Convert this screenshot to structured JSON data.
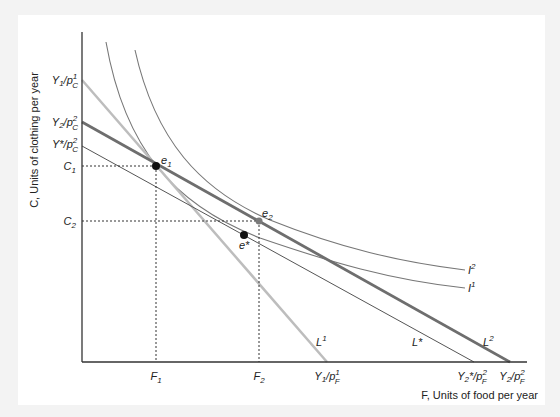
{
  "figure": {
    "y_axis_label": "C, Units of clothing per year",
    "x_axis_label": "F, Units of food per year",
    "y_ticks": [
      {
        "id": "y1pc1",
        "base": "Y",
        "bsub": "1",
        "mid": "/p",
        "sup": "1",
        "sub": "C",
        "y": 80
      },
      {
        "id": "y2pc2",
        "base": "Y",
        "bsub": "2",
        "mid": "/p",
        "sup": "2",
        "sub": "C",
        "y": 122
      },
      {
        "id": "ystarpc2",
        "base": "Y*",
        "bsub": "",
        "mid": "/p",
        "sup": "2",
        "sub": "C",
        "y": 146
      },
      {
        "id": "c1",
        "base": "C",
        "bsub": "1",
        "y": 166
      },
      {
        "id": "c2",
        "base": "C",
        "bsub": "2",
        "y": 221
      }
    ],
    "x_ticks": [
      {
        "id": "f1",
        "base": "F",
        "bsub": "1",
        "x": 156
      },
      {
        "id": "f2",
        "base": "F",
        "bsub": "2",
        "x": 259
      },
      {
        "id": "y1pf1",
        "base": "Y",
        "bsub": "1",
        "mid": "/p",
        "sup": "1",
        "sub": "F",
        "x": 327
      },
      {
        "id": "ystar2pf2",
        "base": "Y",
        "bsub": "2",
        "mid": "*/p",
        "sup": "2",
        "sub": "F",
        "x": 474
      },
      {
        "id": "y2pf2",
        "base": "Y",
        "bsub": "2",
        "mid": "/p",
        "sup": "2",
        "sub": "F",
        "x": 510
      }
    ],
    "points": [
      {
        "id": "e1",
        "label": "e",
        "sub": "1",
        "x": 156,
        "y": 166,
        "color": "#111111"
      },
      {
        "id": "e2",
        "label": "e",
        "sub": "2",
        "x": 259,
        "y": 221,
        "color": "#7a7a7a"
      },
      {
        "id": "estar",
        "label": "e*",
        "sub": "",
        "x": 244,
        "y": 235,
        "color": "#111111"
      }
    ],
    "lines": [
      {
        "id": "L1",
        "label": "L",
        "sup": "1",
        "from": [
          82,
          80
        ],
        "to": [
          327,
          362
        ],
        "color": "#bdbdbd",
        "width": 2.5
      },
      {
        "id": "L2",
        "label": "L",
        "sup": "2",
        "from": [
          82,
          122
        ],
        "to": [
          510,
          362
        ],
        "color": "#6e6e6e",
        "width": 2.8
      },
      {
        "id": "Lstar",
        "label": "L*",
        "sup": "",
        "from": [
          82,
          146
        ],
        "to": [
          474,
          362
        ],
        "color": "#555555",
        "width": 1
      }
    ],
    "curves": [
      {
        "id": "I1",
        "label": "I",
        "sup": "1"
      },
      {
        "id": "I2",
        "label": "I",
        "sup": "2"
      }
    ],
    "colors": {
      "background": "#f3f3f3",
      "panel": "#ffffff",
      "axis": "#333333",
      "indifference": "#777777"
    }
  }
}
